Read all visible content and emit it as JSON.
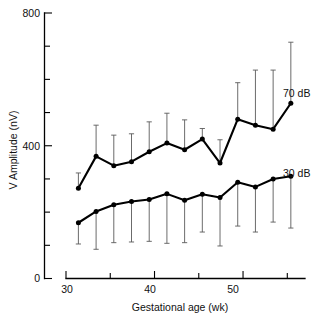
{
  "chart_data": {
    "type": "line",
    "title": "",
    "xlabel": "Gestational age (wk)",
    "ylabel": "V Amplitude (nV)",
    "xlim": [
      30,
      57
    ],
    "ylim": [
      0,
      800
    ],
    "xticks_major": [
      30,
      40,
      50
    ],
    "xticks_minor": [
      35,
      45,
      55
    ],
    "yticks_major": [
      0,
      400,
      800
    ],
    "yticks_minor": [
      100,
      200,
      300,
      500,
      600,
      700
    ],
    "xtick_labels": [
      "30",
      "40",
      "50"
    ],
    "ytick_labels": [
      "0",
      "400",
      "800"
    ],
    "grid": false,
    "legend_position": "inline-right",
    "x": [
      31.4,
      33.4,
      35.4,
      37.4,
      39.4,
      41.4,
      43.4,
      45.4,
      47.4,
      49.4,
      51.4,
      53.4,
      55.4
    ],
    "series": [
      {
        "name": "70 dB",
        "label": "70 dB",
        "values": [
          272,
          368,
          340,
          352,
          382,
          408,
          388,
          420,
          348,
          480,
          462,
          450,
          528
        ],
        "err_upper": [
          318,
          462,
          432,
          436,
          472,
          498,
          478,
          452,
          418,
          590,
          628,
          628,
          712
        ],
        "err_lower": [
          272,
          368,
          340,
          352,
          382,
          408,
          388,
          420,
          348,
          480,
          462,
          450,
          528
        ],
        "marker": "filled-circle"
      },
      {
        "name": "30 dB",
        "label": "30 dB",
        "values": [
          168,
          202,
          222,
          232,
          238,
          255,
          236,
          254,
          244,
          290,
          276,
          300,
          308
        ],
        "err_upper": [
          168,
          202,
          222,
          232,
          238,
          255,
          236,
          254,
          244,
          290,
          276,
          300,
          308
        ],
        "err_lower": [
          104,
          88,
          108,
          110,
          112,
          106,
          108,
          140,
          98,
          158,
          140,
          170,
          152
        ],
        "marker": "filled-circle"
      }
    ]
  },
  "labels": {
    "y_axis_title": "V Amplitude (nV)",
    "x_axis_title": "Gestational age (wk)",
    "y_top": "800",
    "y_mid": "400",
    "y_bottom": "0",
    "x_first": "30",
    "x_second": "40",
    "x_third": "50",
    "series_top": "70 dB",
    "series_bottom": "30 dB"
  },
  "colors": {
    "line": "#000000",
    "errorbar": "#5a5a5a",
    "axis": "#000000",
    "text": "#111111",
    "background": "#ffffff"
  }
}
